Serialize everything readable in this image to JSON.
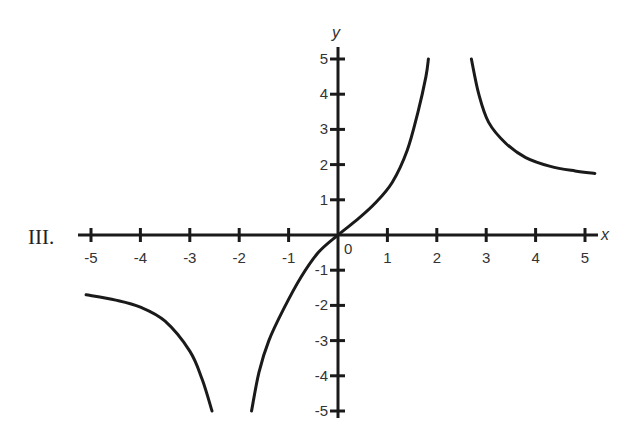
{
  "panel_label": "III.",
  "chart_data": {
    "type": "line",
    "title": "",
    "xlabel": "x",
    "ylabel": "y",
    "xlim": [
      -5.2,
      5.3
    ],
    "ylim": [
      -5,
      5
    ],
    "grid": false,
    "legend": null,
    "x_ticks": [
      -5,
      -4,
      -3,
      -2,
      -1,
      1,
      2,
      3,
      4,
      5
    ],
    "x_tick_labels": [
      "-5",
      "-4",
      "-3",
      "-2",
      "-1",
      "1",
      "2",
      "3",
      "4",
      "5"
    ],
    "y_ticks": [
      5,
      4,
      3,
      2,
      1,
      -1,
      -2,
      -3,
      -4,
      -5
    ],
    "y_tick_labels": [
      "5",
      "4",
      "3",
      "2",
      "1",
      "-1",
      "-2",
      "-3",
      "-4",
      "-5"
    ],
    "origin_label": "0",
    "annotations": [
      "Vertical asymptotes near x ≈ -2.2 and x ≈ 2.2",
      "Curve passes through the origin"
    ],
    "series": [
      {
        "name": "left-branch",
        "points": [
          [
            -5.1,
            -1.7
          ],
          [
            -4.5,
            -1.85
          ],
          [
            -4.0,
            -2.05
          ],
          [
            -3.5,
            -2.45
          ],
          [
            -3.0,
            -3.3
          ],
          [
            -2.75,
            -4.1
          ],
          [
            -2.55,
            -5.0
          ]
        ]
      },
      {
        "name": "middle-branch",
        "points": [
          [
            -1.75,
            -5.0
          ],
          [
            -1.6,
            -3.9
          ],
          [
            -1.4,
            -3.0
          ],
          [
            -1.1,
            -2.1
          ],
          [
            -0.75,
            -1.2
          ],
          [
            -0.4,
            -0.5
          ],
          [
            0.0,
            0.0
          ],
          [
            0.4,
            0.45
          ],
          [
            0.75,
            0.9
          ],
          [
            1.1,
            1.5
          ],
          [
            1.4,
            2.4
          ],
          [
            1.62,
            3.5
          ],
          [
            1.78,
            4.5
          ],
          [
            1.83,
            5.0
          ]
        ]
      },
      {
        "name": "right-branch",
        "points": [
          [
            2.7,
            5.0
          ],
          [
            2.85,
            4.0
          ],
          [
            3.05,
            3.2
          ],
          [
            3.4,
            2.6
          ],
          [
            3.8,
            2.2
          ],
          [
            4.3,
            1.95
          ],
          [
            4.8,
            1.82
          ],
          [
            5.2,
            1.75
          ]
        ]
      }
    ]
  }
}
